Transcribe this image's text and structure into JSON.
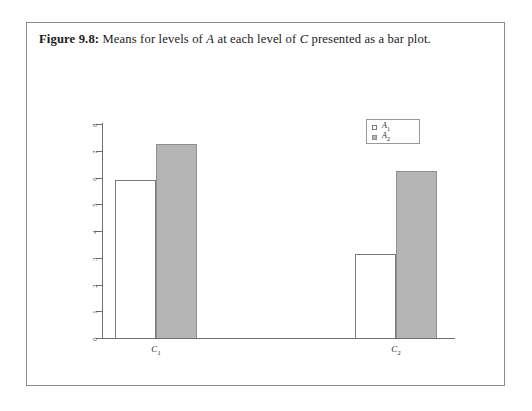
{
  "caption": {
    "label": "Figure 9.8:",
    "text_part1": "Means for levels of",
    "var_a": "A",
    "text_part2": "at each level of",
    "var_c": "C",
    "text_part3": "presented as a bar plot."
  },
  "colors": {
    "bar_fill_a1": "#ffffff",
    "bar_fill_a2": "#b5b5b5",
    "bar_stroke": "#7a7a7a",
    "axis": "#6e6e6e",
    "border": "#8d8d8d",
    "text": "#1a1a1a"
  },
  "chart_data": {
    "type": "bar",
    "title": "",
    "xlabel": "",
    "ylabel": "",
    "categories": [
      "C1",
      "C2"
    ],
    "category_labels": [
      "C",
      "C"
    ],
    "category_subscripts": [
      "1",
      "2"
    ],
    "series": [
      {
        "name": "A1",
        "name_base": "A",
        "name_sub": "1",
        "values": [
          5.9,
          3.15
        ],
        "fill": "#ffffff"
      },
      {
        "name": "A2",
        "name_base": "A",
        "name_sub": "2",
        "values": [
          7.25,
          6.25
        ],
        "fill": "#b5b5b5"
      }
    ],
    "ylim": [
      0,
      8
    ],
    "yticks": [
      0,
      1,
      2,
      3,
      4,
      5,
      6,
      7,
      8
    ],
    "ytick_labels": [
      "0",
      "1",
      "2",
      "3",
      "4",
      "5",
      "6",
      "7",
      "8"
    ],
    "grid": false,
    "legend_position": "top-right",
    "legend_entries": [
      "A1",
      "A2"
    ]
  }
}
